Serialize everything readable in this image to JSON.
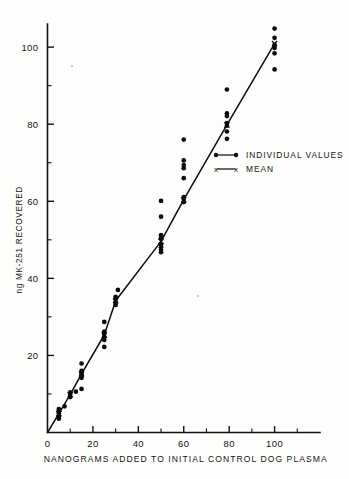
{
  "figure": {
    "background_color": "#fdfdfc",
    "ink_color": "#0b0b0b"
  },
  "chart_data": {
    "type": "scatter",
    "title": "",
    "xlabel": "NANOGRAMS ADDED TO INITIAL CONTROL DOG PLASMA",
    "ylabel": "ng MK-251 RECOVERED",
    "xlim": [
      0,
      120
    ],
    "ylim": [
      0,
      106
    ],
    "grid": false,
    "x_ticks_major": [
      0,
      20,
      40,
      60,
      80,
      100
    ],
    "x_tick_labels": [
      "0",
      "20",
      "40",
      "60",
      "80",
      "100"
    ],
    "x_ticks_minor": [
      10,
      30,
      50,
      70,
      90,
      110
    ],
    "y_ticks_major": [
      20,
      40,
      60,
      80,
      100
    ],
    "y_tick_labels": [
      "20",
      "40",
      "60",
      "80",
      "100"
    ],
    "y_ticks_minor": [
      10,
      30,
      50,
      70,
      90
    ],
    "legend_position": "right-middle",
    "legend": [
      {
        "marker": "dot-line-dot",
        "label": "INDIVIDUAL VALUES"
      },
      {
        "marker": "x-line-x",
        "label": "MEAN"
      }
    ],
    "series": [
      {
        "name": "INDIVIDUAL VALUES",
        "marker": "filled-circle",
        "points": [
          {
            "x": 5,
            "y": 3.6
          },
          {
            "x": 5,
            "y": 4.2
          },
          {
            "x": 5,
            "y": 5.0
          },
          {
            "x": 5,
            "y": 5.6
          },
          {
            "x": 5,
            "y": 6.1
          },
          {
            "x": 7.5,
            "y": 6.8
          },
          {
            "x": 10,
            "y": 9.2
          },
          {
            "x": 10,
            "y": 9.8
          },
          {
            "x": 10,
            "y": 10.4
          },
          {
            "x": 12.5,
            "y": 10.6
          },
          {
            "x": 15,
            "y": 11.3
          },
          {
            "x": 15,
            "y": 14.2
          },
          {
            "x": 15,
            "y": 14.9
          },
          {
            "x": 15,
            "y": 15.4
          },
          {
            "x": 15,
            "y": 16.0
          },
          {
            "x": 15,
            "y": 17.9
          },
          {
            "x": 25,
            "y": 22.2
          },
          {
            "x": 25,
            "y": 24.0
          },
          {
            "x": 25,
            "y": 24.8
          },
          {
            "x": 25,
            "y": 25.6
          },
          {
            "x": 25,
            "y": 26.2
          },
          {
            "x": 25,
            "y": 28.7
          },
          {
            "x": 30,
            "y": 33.1
          },
          {
            "x": 30,
            "y": 33.8
          },
          {
            "x": 30,
            "y": 34.5
          },
          {
            "x": 30,
            "y": 35.2
          },
          {
            "x": 31,
            "y": 37.0
          },
          {
            "x": 50,
            "y": 46.8
          },
          {
            "x": 50,
            "y": 47.4
          },
          {
            "x": 50,
            "y": 48.1
          },
          {
            "x": 50,
            "y": 48.7
          },
          {
            "x": 50,
            "y": 50.4
          },
          {
            "x": 50,
            "y": 51.2
          },
          {
            "x": 50,
            "y": 56.0
          },
          {
            "x": 50,
            "y": 60.1
          },
          {
            "x": 60,
            "y": 59.8
          },
          {
            "x": 60,
            "y": 60.6
          },
          {
            "x": 60,
            "y": 61.1
          },
          {
            "x": 60,
            "y": 66.0
          },
          {
            "x": 60,
            "y": 68.6
          },
          {
            "x": 60,
            "y": 69.4
          },
          {
            "x": 60,
            "y": 70.6
          },
          {
            "x": 60,
            "y": 76.0
          },
          {
            "x": 79,
            "y": 76.2
          },
          {
            "x": 79,
            "y": 78.1
          },
          {
            "x": 79,
            "y": 79.6
          },
          {
            "x": 79,
            "y": 80.3
          },
          {
            "x": 79,
            "y": 82.1
          },
          {
            "x": 79,
            "y": 82.8
          },
          {
            "x": 79,
            "y": 89.0
          },
          {
            "x": 100,
            "y": 94.2
          },
          {
            "x": 100,
            "y": 98.4
          },
          {
            "x": 100,
            "y": 99.8
          },
          {
            "x": 100,
            "y": 100.6
          },
          {
            "x": 100,
            "y": 102.4
          },
          {
            "x": 100,
            "y": 104.8
          }
        ]
      },
      {
        "name": "MEAN",
        "marker": "x",
        "points": [
          {
            "x": 5,
            "y": 4.9
          },
          {
            "x": 10,
            "y": 9.8
          },
          {
            "x": 15,
            "y": 15.2
          },
          {
            "x": 25,
            "y": 25.3
          },
          {
            "x": 30,
            "y": 34.2
          },
          {
            "x": 50,
            "y": 49.6
          },
          {
            "x": 60,
            "y": 60.4
          },
          {
            "x": 79,
            "y": 79.8
          },
          {
            "x": 100,
            "y": 100.9
          }
        ]
      }
    ],
    "fit_line": {
      "name": "mean connecting line",
      "points": [
        {
          "x": 0,
          "y": 0
        },
        {
          "x": 5,
          "y": 4.9
        },
        {
          "x": 10,
          "y": 9.8
        },
        {
          "x": 15,
          "y": 15.2
        },
        {
          "x": 25,
          "y": 25.3
        },
        {
          "x": 30,
          "y": 34.2
        },
        {
          "x": 50,
          "y": 49.6
        },
        {
          "x": 60,
          "y": 60.4
        },
        {
          "x": 79,
          "y": 79.8
        },
        {
          "x": 100,
          "y": 100.9
        }
      ]
    }
  }
}
